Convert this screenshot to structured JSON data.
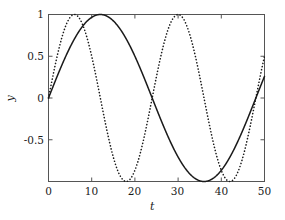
{
  "chart_data": {
    "type": "line",
    "title": "",
    "xlabel": "t",
    "ylabel": "y",
    "xlim": [
      0,
      50
    ],
    "ylim": [
      -1,
      1
    ],
    "xticks": [
      0,
      10,
      20,
      30,
      40,
      50
    ],
    "xtick_labels": [
      "0",
      "10",
      "20",
      "30",
      "40",
      "50"
    ],
    "yticks": [
      -1,
      -0.5,
      0,
      0.5,
      1
    ],
    "ytick_labels": [
      "",
      "-0.5",
      "0",
      "0.5",
      "1"
    ],
    "grid": false,
    "legend": null,
    "series": [
      {
        "name": "solid",
        "style": "solid",
        "color": "#1a1a1a",
        "amplitude": 1,
        "period": 48,
        "phase": 0,
        "description": "sin(2*pi*t/48)",
        "x": [
          0,
          2,
          4,
          6,
          8,
          10,
          12,
          14,
          16,
          18,
          20,
          22,
          24,
          26,
          28,
          30,
          32,
          34,
          36,
          38,
          40,
          42,
          44,
          46,
          48,
          50
        ],
        "y": [
          0,
          0.259,
          0.5,
          0.707,
          0.866,
          0.966,
          1.0,
          0.966,
          0.866,
          0.707,
          0.5,
          0.259,
          0.0,
          -0.259,
          -0.5,
          -0.707,
          -0.866,
          -0.966,
          -1.0,
          -0.966,
          -0.866,
          -0.707,
          -0.5,
          -0.259,
          0.0,
          0.259
        ]
      },
      {
        "name": "dotted",
        "style": "dotted",
        "color": "#1a1a1a",
        "amplitude": 1,
        "period": 24,
        "phase": 0,
        "description": "sin(2*pi*t/24)",
        "x": [
          0,
          2,
          4,
          6,
          8,
          10,
          12,
          14,
          16,
          18,
          20,
          22,
          24,
          26,
          28,
          30,
          32,
          34,
          36,
          38,
          40,
          42,
          44,
          46,
          48,
          50
        ],
        "y": [
          0,
          0.5,
          0.866,
          1.0,
          0.866,
          0.5,
          0.0,
          -0.5,
          -0.866,
          -1.0,
          -0.866,
          -0.5,
          0.0,
          0.5,
          0.866,
          1.0,
          0.866,
          0.5,
          0.0,
          -0.5,
          -0.866,
          -1.0,
          -0.866,
          -0.5,
          0.0,
          0.5
        ]
      }
    ],
    "annotations": []
  },
  "axes": {
    "frame_color": "#555555",
    "tick_color": "#555555",
    "background": "#ffffff"
  }
}
